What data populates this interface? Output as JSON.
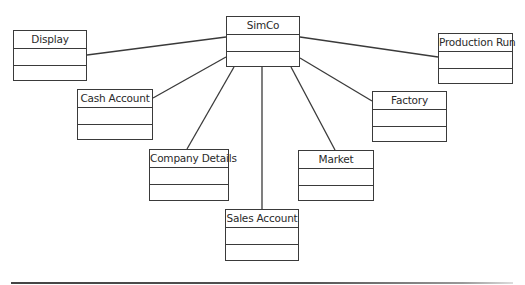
{
  "diagram": {
    "type": "uml-class-diagram",
    "classes": [
      {
        "id": "simco",
        "name": "SimCo",
        "x": 226,
        "y": 16,
        "w": 74,
        "h": 51
      },
      {
        "id": "display",
        "name": "Display",
        "x": 13,
        "y": 30,
        "w": 74,
        "h": 51
      },
      {
        "id": "production-run",
        "name": "Production Run",
        "x": 438,
        "y": 33,
        "w": 75,
        "h": 51
      },
      {
        "id": "cash-account",
        "name": "Cash Account",
        "x": 77,
        "y": 89,
        "w": 76,
        "h": 51
      },
      {
        "id": "factory",
        "name": "Factory",
        "x": 372,
        "y": 91,
        "w": 75,
        "h": 51
      },
      {
        "id": "company-details",
        "name": "Company Details",
        "x": 149,
        "y": 149,
        "w": 80,
        "h": 52
      },
      {
        "id": "market",
        "name": "Market",
        "x": 298,
        "y": 150,
        "w": 76,
        "h": 51
      },
      {
        "id": "sales-account",
        "name": "Sales Account",
        "x": 225,
        "y": 209,
        "w": 74,
        "h": 52
      }
    ],
    "associations": [
      {
        "from": "simco",
        "to": "display",
        "x1": 226,
        "y1": 37,
        "x2": 87,
        "y2": 55
      },
      {
        "from": "simco",
        "to": "cash-account",
        "x1": 226,
        "y1": 57,
        "x2": 153,
        "y2": 98
      },
      {
        "from": "simco",
        "to": "company-details",
        "x1": 234,
        "y1": 67,
        "x2": 187,
        "y2": 149
      },
      {
        "from": "simco",
        "to": "sales-account",
        "x1": 262,
        "y1": 67,
        "x2": 262,
        "y2": 209
      },
      {
        "from": "simco",
        "to": "market",
        "x1": 291,
        "y1": 67,
        "x2": 335,
        "y2": 150
      },
      {
        "from": "simco",
        "to": "factory",
        "x1": 300,
        "y1": 58,
        "x2": 372,
        "y2": 101
      },
      {
        "from": "simco",
        "to": "production-run",
        "x1": 300,
        "y1": 37,
        "x2": 438,
        "y2": 57
      }
    ],
    "colors": {
      "stroke": "#3a3a3a",
      "text": "#2a2a2a",
      "background": "#ffffff"
    }
  },
  "labels": {
    "simco": "SimCo",
    "display": "Display",
    "production_run": "Production Run",
    "cash_account": "Cash Account",
    "factory": "Factory",
    "company_details": "Company Details",
    "market": "Market",
    "sales_account": "Sales Account"
  }
}
